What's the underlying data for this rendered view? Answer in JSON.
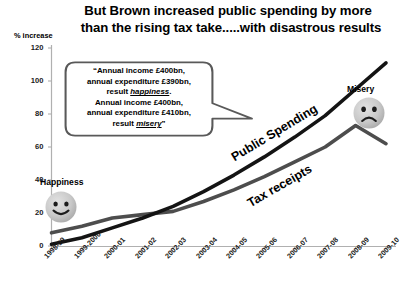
{
  "title": {
    "line1": "But Brown increased public spending by more",
    "line2": "than the rising tax take.....with disastrous results"
  },
  "axis": {
    "y_title": "% increase"
  },
  "callout": {
    "line1": "“Annual income £400bn,",
    "line2": "annual expenditure £390bn,",
    "line3_pre": "result ",
    "line3_em": "happiness",
    "line3_post": ".",
    "line4": "Annual income £400bn,",
    "line5": "annual expenditure £410bn,",
    "line6_pre": "result ",
    "line6_em": "misery",
    "line6_post": "”"
  },
  "annotations": {
    "happiness": "Happiness",
    "misery": "Misery",
    "happy_face_icon": "smiley-happy-face",
    "sad_face_icon": "smiley-sad-face"
  },
  "chart_data": {
    "type": "line",
    "title": "But Brown increased public spending by more than the rising tax take.....with disastrous results",
    "xlabel": "",
    "ylabel": "% increase",
    "ylim": [
      0,
      120
    ],
    "yticks": [
      0,
      20,
      40,
      60,
      80,
      100,
      120
    ],
    "grid": false,
    "legend": "inline-labels",
    "categories": [
      "1998-99",
      "1999-2000",
      "2000-01",
      "2001-02",
      "2002-03",
      "2003-04",
      "2004-05",
      "2005-06",
      "2006-07",
      "2007-08",
      "2008-09",
      "2009-10"
    ],
    "series": [
      {
        "name": "Public Spending",
        "color": "#1a1a1a",
        "values": [
          1,
          5,
          11,
          17,
          24,
          33,
          43,
          54,
          66,
          79,
          95,
          111
        ]
      },
      {
        "name": "Tax receipts",
        "color": "#4d4d4d",
        "values": [
          8,
          12,
          17,
          19,
          21,
          27,
          34,
          42,
          51,
          60,
          73,
          62
        ]
      }
    ]
  }
}
